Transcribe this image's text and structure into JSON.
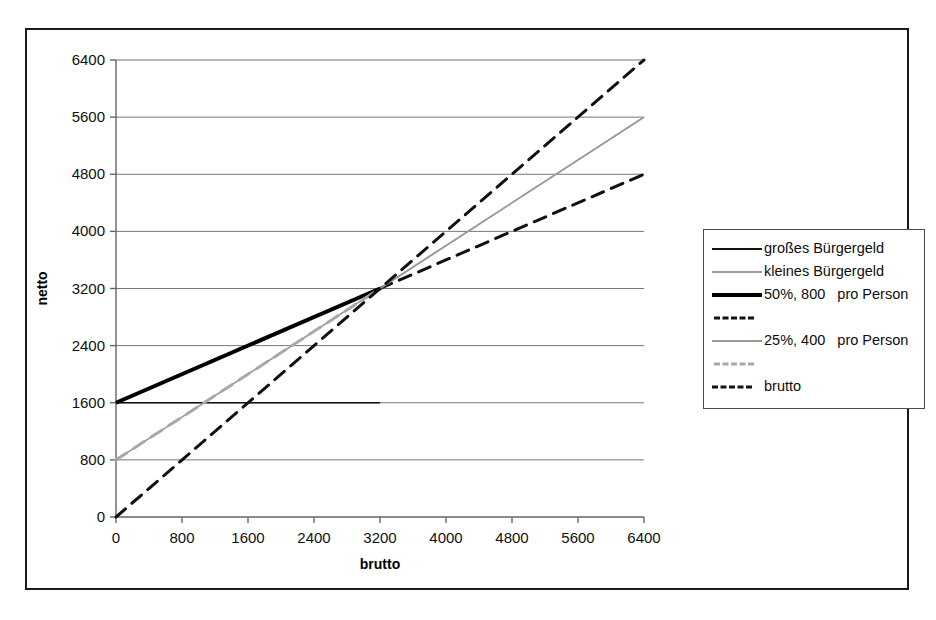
{
  "chart_data": {
    "type": "line",
    "title": "",
    "xlabel": "brutto",
    "ylabel": "netto",
    "xlim": [
      0,
      6400
    ],
    "ylim": [
      0,
      6400
    ],
    "xticks": [
      0,
      800,
      1600,
      2400,
      3200,
      4000,
      4800,
      5600,
      6400
    ],
    "yticks": [
      0,
      800,
      1600,
      2400,
      3200,
      4000,
      4800,
      5600,
      6400
    ],
    "grid": "horizontal",
    "legend_position": "right-outside",
    "series": [
      {
        "name": "großes Bürgergeld",
        "style": "solid",
        "color": "#111111",
        "width": 1.6,
        "x": [
          0,
          3200
        ],
        "y": [
          1600,
          1600
        ]
      },
      {
        "name": "kleines Bürgergeld",
        "style": "solid",
        "color": "#999999",
        "width": 1.6,
        "x": [
          0,
          6400
        ],
        "y": [
          800,
          5600
        ]
      },
      {
        "name": "50%, 800   pro Person",
        "style": "solid",
        "color": "#000000",
        "width": 4,
        "x": [
          0,
          3200
        ],
        "y": [
          1600,
          3200
        ]
      },
      {
        "name": "",
        "style": "dashed",
        "color": "#111111",
        "width": 3,
        "x": [
          3200,
          6400
        ],
        "y": [
          3200,
          4800
        ]
      },
      {
        "name": "25%, 400   pro Person",
        "style": "solid",
        "color": "#999999",
        "width": 1.6,
        "x": [
          3200,
          6400
        ],
        "y": [
          3200,
          5600
        ]
      },
      {
        "name": "",
        "style": "dashed",
        "color": "#a8a8a8",
        "width": 3,
        "x": [
          0,
          3200
        ],
        "y": [
          800,
          3200
        ]
      },
      {
        "name": "brutto",
        "style": "dashed",
        "color": "#111111",
        "width": 3,
        "x": [
          0,
          6400
        ],
        "y": [
          0,
          6400
        ]
      }
    ]
  },
  "axes": {
    "y_title": "netto",
    "x_title": "brutto",
    "y_tick_labels": [
      "6400",
      "5600",
      "4800",
      "4000",
      "3200",
      "2400",
      "1600",
      "800",
      "0"
    ],
    "x_tick_labels": [
      "0",
      "800",
      "1600",
      "2400",
      "3200",
      "4000",
      "4800",
      "5600",
      "6400"
    ]
  },
  "legend": {
    "items": [
      {
        "label": "großes Bürgergeld",
        "swatch": "sw-solid-black-thin"
      },
      {
        "label": "kleines Bürgergeld",
        "swatch": "sw-solid-gray-thin"
      },
      {
        "label": "50%, 800   pro Person",
        "swatch": "sw-solid-black-thick"
      },
      {
        "label": "",
        "swatch": "sw-dash-black"
      },
      {
        "label": "25%, 400   pro Person",
        "swatch": "sw-solid-gray"
      },
      {
        "label": "",
        "swatch": "sw-dash-gray"
      },
      {
        "label": "brutto",
        "swatch": "sw-dash-black2"
      }
    ]
  },
  "colors": {
    "frame": "#1a1a1a",
    "axis": "#666666",
    "grid": "#777777",
    "black_series": "#111111",
    "gray_series": "#999999",
    "background": "#ffffff"
  }
}
